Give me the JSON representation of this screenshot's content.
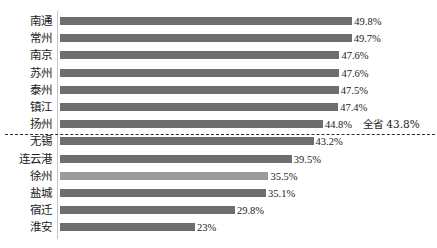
{
  "chart_data": {
    "type": "bar",
    "orientation": "horizontal",
    "title": "",
    "xlabel": "",
    "ylabel": "",
    "grid": false,
    "legend": "none",
    "xlim": [
      0,
      52
    ],
    "categories": [
      "南通",
      "常州",
      "南京",
      "苏州",
      "泰州",
      "镇江",
      "扬州",
      "无锡",
      "连云港",
      "徐州",
      "盐城",
      "宿迁",
      "淮安"
    ],
    "values": [
      49.8,
      49.7,
      47.6,
      47.6,
      47.5,
      47.4,
      44.8,
      43.2,
      39.5,
      35.5,
      35.1,
      29.8,
      23.0
    ],
    "value_labels": [
      "49.8%",
      "49.7%",
      "47.6%",
      "47.6%",
      "47.5%",
      "47.4%",
      "44.8%",
      "43.2%",
      "39.5%",
      "35.5%",
      "35.1%",
      "29.8%",
      "23%"
    ],
    "highlight_index": 9,
    "bar_color": "#6e6e6e",
    "highlight_color": "#9c9c9c",
    "reference_line": {
      "label": "全省 43.8%",
      "value": 43.8,
      "after_category": "扬州",
      "style": "dashed"
    }
  },
  "annotations": {
    "province_average": "全省 43.8%"
  }
}
